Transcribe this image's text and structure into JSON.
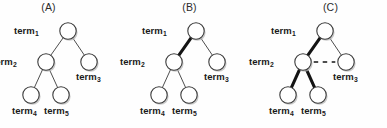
{
  "figure": {
    "background_color": "#fefefe",
    "node_fill": "#ffffff",
    "node_stroke": "#3a3a3a",
    "edge_color": "#3a3a3a",
    "bold_edge_color": "#141414",
    "label_color": "#1a1a1a",
    "shadow_color": "#b9b9b9"
  },
  "panels": [
    {
      "id": "A",
      "title": "(A)",
      "nodes": [
        {
          "name": "term1",
          "label": "term",
          "sub": "1",
          "cx": 68,
          "cy": 31,
          "r": 8.2,
          "label_x": 14,
          "label_y": 26,
          "label_anchor": "left"
        },
        {
          "name": "term2",
          "label": "term",
          "sub": "2",
          "cx": 46,
          "cy": 62,
          "r": 8.2,
          "label_x": -8,
          "label_y": 57,
          "label_anchor": "left"
        },
        {
          "name": "term3",
          "label": "term",
          "sub": "3",
          "cx": 89,
          "cy": 62,
          "r": 8.2,
          "label_x": 76,
          "label_y": 72,
          "label_anchor": "left"
        },
        {
          "name": "term4",
          "label": "term",
          "sub": "4",
          "cx": 31,
          "cy": 95,
          "r": 8.2,
          "label_x": 12,
          "label_y": 106,
          "label_anchor": "left"
        },
        {
          "name": "term5",
          "label": "term",
          "sub": "5",
          "cx": 61,
          "cy": 95,
          "r": 8.2,
          "label_x": 44,
          "label_y": 106,
          "label_anchor": "left"
        }
      ],
      "edges": [
        {
          "from": "term1",
          "to": "term2",
          "bold": false
        },
        {
          "from": "term1",
          "to": "term3",
          "bold": false
        },
        {
          "from": "term2",
          "to": "term4",
          "bold": false
        },
        {
          "from": "term2",
          "to": "term5",
          "bold": false
        }
      ],
      "dashed_links": []
    },
    {
      "id": "B",
      "title": "(B)",
      "nodes": [
        {
          "name": "term1",
          "label": "term",
          "sub": "1",
          "cx": 68,
          "cy": 31,
          "r": 8.2,
          "label_x": 14,
          "label_y": 26,
          "label_anchor": "left"
        },
        {
          "name": "term2",
          "label": "term",
          "sub": "2",
          "cx": 46,
          "cy": 62,
          "r": 8.2,
          "label_x": -8,
          "label_y": 57,
          "label_anchor": "left"
        },
        {
          "name": "term3",
          "label": "term",
          "sub": "3",
          "cx": 89,
          "cy": 62,
          "r": 8.2,
          "label_x": 76,
          "label_y": 72,
          "label_anchor": "left"
        },
        {
          "name": "term4",
          "label": "term",
          "sub": "4",
          "cx": 31,
          "cy": 95,
          "r": 8.2,
          "label_x": 12,
          "label_y": 106,
          "label_anchor": "left"
        },
        {
          "name": "term5",
          "label": "term",
          "sub": "5",
          "cx": 61,
          "cy": 95,
          "r": 8.2,
          "label_x": 44,
          "label_y": 106,
          "label_anchor": "left"
        }
      ],
      "edges": [
        {
          "from": "term1",
          "to": "term2",
          "bold": true
        },
        {
          "from": "term1",
          "to": "term3",
          "bold": false
        },
        {
          "from": "term2",
          "to": "term4",
          "bold": false
        },
        {
          "from": "term2",
          "to": "term5",
          "bold": false
        }
      ],
      "dashed_links": []
    },
    {
      "id": "C",
      "title": "(C)",
      "nodes": [
        {
          "name": "term1",
          "label": "term",
          "sub": "1",
          "cx": 68,
          "cy": 31,
          "r": 8.2,
          "label_x": 14,
          "label_y": 26,
          "label_anchor": "left"
        },
        {
          "name": "term2",
          "label": "term",
          "sub": "2",
          "cx": 46,
          "cy": 62,
          "r": 8.2,
          "label_x": -8,
          "label_y": 57,
          "label_anchor": "left"
        },
        {
          "name": "term3",
          "label": "term",
          "sub": "3",
          "cx": 89,
          "cy": 62,
          "r": 8.2,
          "label_x": 76,
          "label_y": 72,
          "label_anchor": "left"
        },
        {
          "name": "term4",
          "label": "term",
          "sub": "4",
          "cx": 31,
          "cy": 95,
          "r": 8.2,
          "label_x": 12,
          "label_y": 106,
          "label_anchor": "left"
        },
        {
          "name": "term5",
          "label": "term",
          "sub": "5",
          "cx": 61,
          "cy": 95,
          "r": 8.2,
          "label_x": 44,
          "label_y": 106,
          "label_anchor": "left"
        }
      ],
      "edges": [
        {
          "from": "term1",
          "to": "term2",
          "bold": true
        },
        {
          "from": "term1",
          "to": "term3",
          "bold": false
        },
        {
          "from": "term2",
          "to": "term4",
          "bold": true
        },
        {
          "from": "term2",
          "to": "term5",
          "bold": true
        }
      ],
      "dashed_links": [
        {
          "from": "term2",
          "to": "term3"
        }
      ]
    }
  ]
}
